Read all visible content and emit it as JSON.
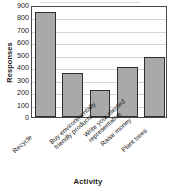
{
  "chart_data": {
    "type": "bar",
    "title": "",
    "xlabel": "Activity",
    "ylabel": "Responses",
    "categories": [
      "Recycle",
      "Buy environmentally friendly products",
      "Write your elected representative",
      "Raise money",
      "Plant trees"
    ],
    "category_lines": [
      [
        "Recycle"
      ],
      [
        "Buy environmentally",
        "friendly products"
      ],
      [
        "Write your elected",
        "representative"
      ],
      [
        "Raise money"
      ],
      [
        "Plant trees"
      ]
    ],
    "values": [
      840,
      355,
      220,
      405,
      485
    ],
    "ylim": [
      0,
      900
    ],
    "yticks": [
      0,
      100,
      200,
      300,
      400,
      500,
      600,
      700,
      800,
      900
    ],
    "ytick_labels": [
      "0",
      "100",
      "200",
      "300",
      "400",
      "500",
      "600",
      "700",
      "800",
      "900"
    ],
    "grid": true,
    "legend": false,
    "bar_color": "#a9a9a9",
    "bar_border_color": "#2e2e2e",
    "gridline_color": "#d5d5d5",
    "frame_color": "#4a4a4a"
  }
}
